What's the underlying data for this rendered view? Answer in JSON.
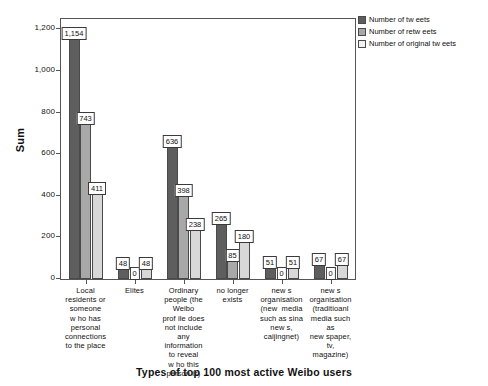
{
  "chart_data": {
    "type": "bar",
    "title": "Types of top 100 most active Weibo users",
    "xlabel": "Types of top 100 most active Weibo users",
    "ylabel": "Sum",
    "ylim": [
      0,
      1250
    ],
    "yticks": [
      "0",
      "200",
      "400",
      "600",
      "800",
      "1,000",
      "1,200"
    ],
    "ytick_values": [
      0,
      200,
      400,
      600,
      800,
      1000,
      1200
    ],
    "grid": false,
    "legend_position": "top-right",
    "categories": [
      "Local residents or someone who has personal connections to the place",
      "Elites",
      "Ordinary people (the Weibo profile does not include any information to reveal who this person is)",
      "no longer exists",
      "new s organisation (new media such as sina new s, caijingnet)",
      "new s organisation (traditioanl media such as new spaper, tv, magazine)"
    ],
    "category_lines": [
      [
        "Local",
        "residents or",
        "someone",
        "w ho has",
        "personal",
        "connections",
        "to the place"
      ],
      [
        "Elites"
      ],
      [
        "Ordinary",
        "people (the",
        "Weibo",
        "prof ile does",
        "not include",
        "any",
        "information",
        "to reveal",
        "w ho this",
        "person is)"
      ],
      [
        "no longer",
        "exists"
      ],
      [
        "new s",
        "organisation",
        "(new  media",
        "such as sina",
        "new s,",
        "caijingnet)"
      ],
      [
        "new s",
        "organisation",
        "(traditioanl",
        "media such",
        "as",
        "new spaper,",
        "tv,",
        "magazine)"
      ]
    ],
    "series": [
      {
        "name": "Number of tw eets",
        "color": "#5e5e5e",
        "values": [
          1154,
          48,
          636,
          265,
          51,
          67
        ],
        "labels": [
          "1,154",
          "48",
          "636",
          "265",
          "51",
          "67"
        ]
      },
      {
        "name": "Number of retw eets",
        "color": "#a8a8a8",
        "values": [
          743,
          0,
          398,
          85,
          0,
          0
        ],
        "labels": [
          "743",
          "0",
          "398",
          "85",
          "0",
          "0"
        ]
      },
      {
        "name": "Number of original tw eets",
        "color": "#d8d8d8",
        "values": [
          411,
          48,
          238,
          180,
          51,
          67
        ],
        "labels": [
          "411",
          "48",
          "238",
          "180",
          "51",
          "67"
        ]
      }
    ]
  },
  "legend": {
    "items": [
      {
        "label": "Number of tw eets"
      },
      {
        "label": "Number of retw eets"
      },
      {
        "label": "Number of original tw eets"
      }
    ]
  },
  "axis": {
    "y_title": "Sum"
  }
}
